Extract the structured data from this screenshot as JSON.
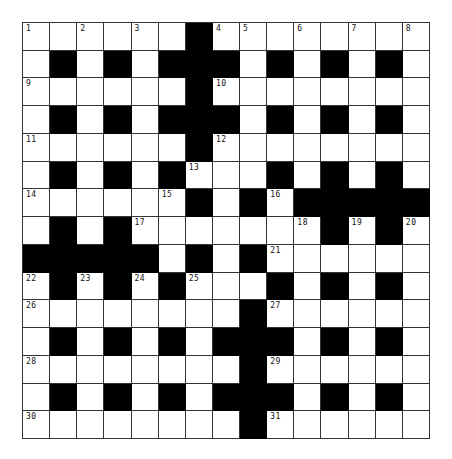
{
  "puzzle": {
    "size": {
      "rows": 15,
      "cols": 15
    },
    "colors": {
      "block": "#000000",
      "cell": "#ffffff",
      "line": "#333333"
    },
    "grid": [
      "......#........",
      ".#.#.###.#.#.#.",
      "......#........",
      ".#.#.###.#.#.#.",
      "......#........",
      ".#.#.#...#.#.#.",
      "......#.#.#####",
      ".#.#.......#.#.",
      "#####.#.#......",
      ".#.#.#...#.#.#.",
      "........#......",
      ".#.#.#.###.#.#.",
      "........#......",
      ".#.#.#.###.#.#.",
      "........#......"
    ],
    "numbers": [
      {
        "r": 0,
        "c": 0,
        "n": "1"
      },
      {
        "r": 0,
        "c": 2,
        "n": "2"
      },
      {
        "r": 0,
        "c": 4,
        "n": "3"
      },
      {
        "r": 0,
        "c": 7,
        "n": "4"
      },
      {
        "r": 0,
        "c": 8,
        "n": "5"
      },
      {
        "r": 0,
        "c": 10,
        "n": "6"
      },
      {
        "r": 0,
        "c": 12,
        "n": "7"
      },
      {
        "r": 0,
        "c": 14,
        "n": "8"
      },
      {
        "r": 2,
        "c": 0,
        "n": "9"
      },
      {
        "r": 2,
        "c": 7,
        "n": "10"
      },
      {
        "r": 4,
        "c": 0,
        "n": "11"
      },
      {
        "r": 4,
        "c": 7,
        "n": "12"
      },
      {
        "r": 5,
        "c": 6,
        "n": "13"
      },
      {
        "r": 6,
        "c": 0,
        "n": "14"
      },
      {
        "r": 6,
        "c": 5,
        "n": "15"
      },
      {
        "r": 6,
        "c": 9,
        "n": "16"
      },
      {
        "r": 7,
        "c": 4,
        "n": "17"
      },
      {
        "r": 7,
        "c": 10,
        "n": "18"
      },
      {
        "r": 7,
        "c": 12,
        "n": "19"
      },
      {
        "r": 7,
        "c": 14,
        "n": "20"
      },
      {
        "r": 8,
        "c": 9,
        "n": "21"
      },
      {
        "r": 9,
        "c": 0,
        "n": "22"
      },
      {
        "r": 9,
        "c": 2,
        "n": "23"
      },
      {
        "r": 9,
        "c": 4,
        "n": "24"
      },
      {
        "r": 9,
        "c": 6,
        "n": "25"
      },
      {
        "r": 10,
        "c": 0,
        "n": "26"
      },
      {
        "r": 10,
        "c": 9,
        "n": "27"
      },
      {
        "r": 12,
        "c": 0,
        "n": "28"
      },
      {
        "r": 12,
        "c": 9,
        "n": "29"
      },
      {
        "r": 14,
        "c": 0,
        "n": "30"
      },
      {
        "r": 14,
        "c": 9,
        "n": "31"
      }
    ]
  }
}
